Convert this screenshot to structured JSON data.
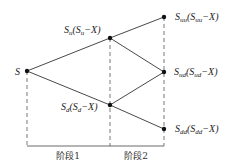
{
  "diagram": {
    "title": "",
    "colors": {
      "line": "#333333",
      "node": "#111111",
      "background": "#ffffff"
    },
    "nodes": [
      {
        "id": "S",
        "x": 27,
        "y": 71,
        "label": "S",
        "sub": ""
      },
      {
        "id": "Su",
        "x": 110,
        "y": 38,
        "label": "S",
        "sub": "u",
        "payoff": "(S",
        "payoff_sub": "u",
        "payoff_tail": "−X)"
      },
      {
        "id": "Sd",
        "x": 110,
        "y": 105,
        "label": "S",
        "sub": "d",
        "payoff": "(S",
        "payoff_sub": "d",
        "payoff_tail": "−X)"
      },
      {
        "id": "Suu",
        "x": 164,
        "y": 17,
        "label": "S",
        "sub": "uu",
        "payoff": "(S",
        "payoff_sub": "uu",
        "payoff_tail": "−X)"
      },
      {
        "id": "Sud",
        "x": 164,
        "y": 72,
        "label": "S",
        "sub": "ud",
        "payoff": "(S",
        "payoff_sub": "ud",
        "payoff_tail": "−X)"
      },
      {
        "id": "Sdd",
        "x": 164,
        "y": 129,
        "label": "S",
        "sub": "dd",
        "payoff": "(S",
        "payoff_sub": "dd",
        "payoff_tail": "−X)"
      }
    ],
    "edges": [
      [
        "S",
        "Su"
      ],
      [
        "S",
        "Sd"
      ],
      [
        "Su",
        "Suu"
      ],
      [
        "Su",
        "Sud"
      ],
      [
        "Sd",
        "Sud"
      ],
      [
        "Sd",
        "Sdd"
      ]
    ],
    "stages": [
      {
        "label": "阶段1"
      },
      {
        "label": "阶段2"
      }
    ]
  }
}
